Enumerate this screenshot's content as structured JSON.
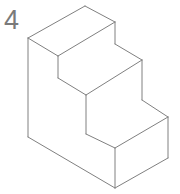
{
  "figure": {
    "number_label": "4",
    "type": "isometric-technical-drawing",
    "background_color": "#ffffff",
    "line_color": "#808080",
    "label_color": "#7a7a7a",
    "face_fill": "#ffffff",
    "line_width": 1,
    "step_count": 3,
    "canvas": {
      "width": 180,
      "height": 194
    }
  },
  "geometry": {
    "outline_points": "85,6 115,22 115,44 142,60 142,100 168,117 168,158 115,188 28,137 28,38",
    "faces": {
      "tread_top_step": "85,6 115,22 58,56 28,38",
      "riser_top_step": "115,22 115,44 58,78 58,56",
      "tread_middle_step": "115,44 142,60 86,95 58,78",
      "riser_middle_step": "142,60 142,100 86,134 86,95",
      "tread_bottom_step": "142,100 168,117 115,148 86,134",
      "riser_bottom_step": "168,117 168,158 115,188 115,148",
      "left_side_profile": "85,6 28,38 28,137 115,188 115,148 86,134 86,95 58,78 58,56",
      "base_front": "28,137 115,188 115,148"
    },
    "edges": [
      {
        "name": "top-back-left-edge",
        "points": "85,6 28,38"
      },
      {
        "name": "top-back-right-edge",
        "points": "85,6 115,22"
      },
      {
        "name": "top-tread-front-left",
        "points": "28,38 58,56"
      },
      {
        "name": "top-tread-front-right",
        "points": "58,56 115,22"
      },
      {
        "name": "top-riser-right-vertical",
        "points": "115,22 115,44"
      },
      {
        "name": "top-riser-left-vertical",
        "points": "58,56 58,78"
      },
      {
        "name": "middle-tread-back-right",
        "points": "115,44 142,60"
      },
      {
        "name": "middle-tread-left",
        "points": "58,78 86,95"
      },
      {
        "name": "middle-tread-right",
        "points": "86,95 142,60"
      },
      {
        "name": "middle-riser-right-vertical",
        "points": "142,60 142,100"
      },
      {
        "name": "middle-riser-left-vertical",
        "points": "86,95 86,134"
      },
      {
        "name": "bottom-tread-back-right",
        "points": "142,100 168,117"
      },
      {
        "name": "bottom-tread-left",
        "points": "86,134 115,148"
      },
      {
        "name": "bottom-tread-right",
        "points": "115,148 168,117"
      },
      {
        "name": "bottom-riser-right-vertical",
        "points": "168,117 168,158"
      },
      {
        "name": "front-bottom-vertical",
        "points": "115,148 115,188"
      },
      {
        "name": "bottom-front-right-edge",
        "points": "115,188 168,158"
      },
      {
        "name": "left-side-vertical",
        "points": "28,38 28,137"
      },
      {
        "name": "bottom-front-left-edge",
        "points": "28,137 115,188"
      }
    ]
  }
}
